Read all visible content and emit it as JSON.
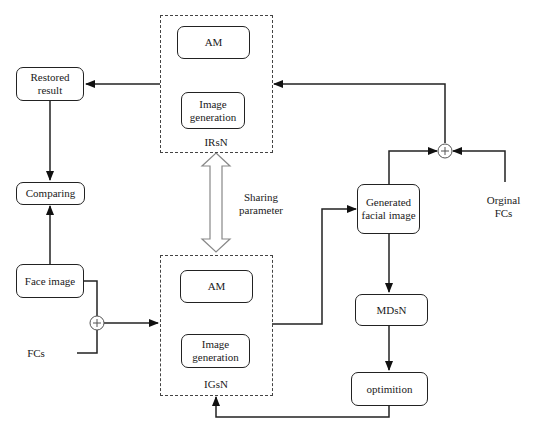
{
  "diagram": {
    "modules": {
      "irsn": {
        "label": "IRsN",
        "children": [
          "AM",
          "Image generation"
        ]
      },
      "igsn": {
        "label": "IGsN",
        "children": [
          "AM",
          "Image generation"
        ]
      }
    },
    "nodes": {
      "restored_result": "Restored result",
      "comparing": "Comparing",
      "face_image": "Face image",
      "fcs": "FCs",
      "irsn_am": "AM",
      "irsn_image_generation": "Image generation",
      "igsn_am": "AM",
      "igsn_image_generation": "Image generation",
      "generated_facial_image": "Generated facial image",
      "mdsn": "MDsN",
      "optimition": "optimition",
      "original_fcs": "Orginal FCs"
    },
    "labels": {
      "irsn": "IRsN",
      "igsn": "IGsN",
      "sharing_parameter": "Sharing parameter",
      "plus_symbol": "+"
    },
    "edges": [
      {
        "from": "IRsN",
        "to": "Restored result"
      },
      {
        "from": "Restored result",
        "to": "Comparing"
      },
      {
        "from": "Face image",
        "to": "Comparing"
      },
      {
        "from": "Face image",
        "to": "sum-left"
      },
      {
        "from": "FCs",
        "to": "sum-left"
      },
      {
        "from": "sum-left",
        "to": "IGsN"
      },
      {
        "from": "IGsN",
        "to": "Generated facial image"
      },
      {
        "from": "Generated facial image",
        "to": "MDsN"
      },
      {
        "from": "MDsN",
        "to": "optimition"
      },
      {
        "from": "optimition",
        "to": "IGsN"
      },
      {
        "from": "Generated facial image",
        "to": "sum-right"
      },
      {
        "from": "Orginal FCs",
        "to": "sum-right"
      },
      {
        "from": "sum-right",
        "to": "IRsN"
      },
      {
        "from": "IRsN",
        "to": "IGsN",
        "type": "bidirectional",
        "label": "Sharing parameter"
      }
    ]
  }
}
